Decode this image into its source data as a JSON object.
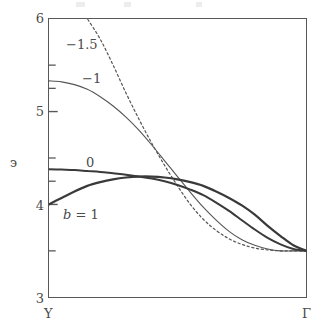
{
  "figure": {
    "background": "#ffffff",
    "frame_color": "#585858",
    "axis_label_color": "#4a4a4a"
  },
  "axes": {
    "y_axis_title": "э",
    "y_tick_labels": [
      "6",
      "5",
      "4",
      "3"
    ],
    "x_tick_labels": [
      "Y",
      "Γ"
    ]
  },
  "curve_labels": {
    "minus_one_point_five": "−1.5",
    "minus_one": "−1",
    "zero": "0",
    "b_equals_one_b": "b",
    "b_equals_one_rest": " = 1"
  },
  "chart_data": {
    "type": "line",
    "title": "",
    "xlabel": "",
    "ylabel": "э",
    "xlim": [
      0,
      1
    ],
    "ylim": [
      3,
      6
    ],
    "grid": false,
    "legend": "inline-annotations",
    "x_tick_positions": [
      0,
      1
    ],
    "x_tick_labels": [
      "Y",
      "Γ"
    ],
    "y_major_ticks": [
      3,
      4,
      5,
      6
    ],
    "y_minor_ticks": [
      3.5,
      4.25,
      4.5,
      5.25,
      5.5
    ],
    "x_normalized": [
      0,
      0.05,
      0.1,
      0.15,
      0.2,
      0.25,
      0.3,
      0.35,
      0.4,
      0.45,
      0.5,
      0.55,
      0.6,
      0.65,
      0.7,
      0.75,
      0.8,
      0.85,
      0.9,
      0.95,
      1
    ],
    "series": [
      {
        "name": "−1.5",
        "label": "−1.5",
        "style": "dashed",
        "width": 1.2,
        "color": "#555555",
        "note": "enters top of frame at x≈0.16; clipped above ε=6",
        "values": [
          null,
          null,
          null,
          6.0,
          5.78,
          5.5,
          5.2,
          4.92,
          4.66,
          4.42,
          4.2,
          4.0,
          3.84,
          3.72,
          3.63,
          3.57,
          3.53,
          3.51,
          3.5,
          3.5,
          3.5
        ]
      },
      {
        "name": "−1",
        "label": "−1",
        "style": "solid-thin",
        "width": 1.1,
        "color": "#555555",
        "values": [
          5.33,
          5.32,
          5.29,
          5.24,
          5.16,
          5.06,
          4.94,
          4.8,
          4.64,
          4.47,
          4.3,
          4.13,
          3.97,
          3.83,
          3.71,
          3.62,
          3.56,
          3.52,
          3.5,
          3.5,
          3.5
        ]
      },
      {
        "name": "0",
        "label": "0",
        "style": "solid-thick",
        "width": 2.0,
        "color": "#3a3a3a",
        "values": [
          4.38,
          4.375,
          4.37,
          4.36,
          4.35,
          4.335,
          4.32,
          4.3,
          4.28,
          4.25,
          4.21,
          4.16,
          4.1,
          4.02,
          3.93,
          3.83,
          3.73,
          3.64,
          3.57,
          3.52,
          3.5
        ]
      },
      {
        "name": "b = 1",
        "label": "b = 1",
        "style": "solid-thick",
        "width": 2.2,
        "color": "#3a3a3a",
        "values": [
          4.0,
          4.07,
          4.14,
          4.2,
          4.24,
          4.27,
          4.29,
          4.3,
          4.3,
          4.29,
          4.27,
          4.24,
          4.2,
          4.14,
          4.07,
          3.99,
          3.89,
          3.77,
          3.66,
          3.56,
          3.5
        ]
      }
    ]
  },
  "annotation_positions": {
    "minus_one_point_five": {
      "x": 66,
      "y": 38
    },
    "minus_one": {
      "x": 82,
      "y": 72
    },
    "zero": {
      "x": 86,
      "y": 156
    },
    "b_equals_one": {
      "x": 63,
      "y": 208
    }
  }
}
